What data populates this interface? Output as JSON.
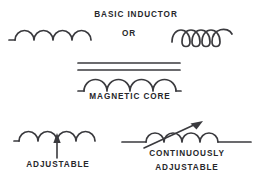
{
  "figure": {
    "background_color": "#ffffff",
    "ink_color": "#3a3a3e",
    "text_color": "#27272b",
    "width": 257,
    "height": 182
  },
  "labels": {
    "basic_inductor": "BASIC INDUCTOR",
    "or": "OR",
    "magnetic_core": "MAGNETIC CORE",
    "adjustable": "ADJUSTABLE",
    "continuously_adjustable_line1": "CONTINUOUSLY",
    "continuously_adjustable_line2": "ADJUSTABLE"
  },
  "symbols": [
    {
      "id": "basic-inductor-arc",
      "name": "basic-inductor-arc-symbol",
      "style": "arc-humps",
      "coils": 4,
      "leads": [
        "left",
        "right"
      ],
      "caption": "BASIC INDUCTOR"
    },
    {
      "id": "basic-inductor-loop",
      "name": "basic-inductor-loop-symbol",
      "style": "helical-loops",
      "coils": 3,
      "leads": [
        "left",
        "right"
      ],
      "caption": "BASIC INDUCTOR"
    },
    {
      "id": "magnetic-core-inductor",
      "name": "magnetic-core-inductor-symbol",
      "style": "arc-humps",
      "coils": 4,
      "core_lines": 2,
      "leads": [
        "left",
        "right"
      ],
      "caption": "MAGNETIC CORE"
    },
    {
      "id": "adjustable-inductor",
      "name": "adjustable-inductor-symbol",
      "style": "arc-humps",
      "coils": 4,
      "arrow": "vertical-up",
      "leads": [
        "left",
        "right"
      ],
      "caption": "ADJUSTABLE"
    },
    {
      "id": "continuously-adjustable-inductor",
      "name": "continuously-adjustable-inductor-symbol",
      "style": "arc-humps",
      "coils": 4,
      "arrow": "diagonal-up-right",
      "leads": [
        "left",
        "right"
      ],
      "caption": "CONTINUOUSLY ADJUSTABLE"
    }
  ]
}
